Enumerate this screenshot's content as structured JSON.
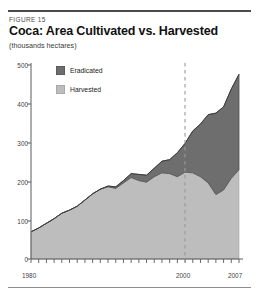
{
  "figure": {
    "label": "FIGURE 15",
    "title": "Coca: Area Cultivated vs. Harvested",
    "units": "(thousands hectares)"
  },
  "legend": {
    "position": "inside-top-left",
    "items": [
      {
        "label": "Eradicated",
        "color": "#6e6e6e",
        "swatch": "eradicated-swatch"
      },
      {
        "label": "Harvested",
        "color": "#bdbdbd",
        "swatch": "harvested-swatch"
      }
    ]
  },
  "axes": {
    "y_ticks": [
      "0",
      "100",
      "200",
      "300",
      "400",
      "500"
    ],
    "x_ticks_labeled": [
      "1980",
      "2000",
      "2007"
    ]
  },
  "annotations": [
    {
      "name": "year-2000-reference-line",
      "type": "vertical-dashed",
      "x_value": 2000,
      "color": "#9a9a9a"
    }
  ],
  "chart_data": {
    "type": "area",
    "stacked": true,
    "title": "Coca: Area Cultivated vs. Harvested",
    "subtitle": "FIGURE 15",
    "xlabel": "",
    "ylabel": "thousands hectares",
    "ylim": [
      0,
      500
    ],
    "xlim": [
      1980,
      2007
    ],
    "grid": false,
    "legend_entries": [
      "Eradicated",
      "Harvested"
    ],
    "x": [
      1980,
      1981,
      1982,
      1983,
      1984,
      1985,
      1986,
      1987,
      1988,
      1989,
      1990,
      1991,
      1992,
      1993,
      1994,
      1995,
      1996,
      1997,
      1998,
      1999,
      2000,
      2001,
      2002,
      2003,
      2004,
      2005,
      2006,
      2007
    ],
    "series": [
      {
        "name": "Harvested",
        "color": "#bdbdbd",
        "values": [
          70,
          80,
          92,
          104,
          118,
          126,
          136,
          152,
          168,
          180,
          186,
          182,
          196,
          210,
          202,
          198,
          212,
          222,
          220,
          212,
          224,
          222,
          212,
          196,
          166,
          178,
          208,
          230
        ]
      },
      {
        "name": "Eradicated",
        "color": "#6e6e6e",
        "values": [
          0,
          0,
          0,
          0,
          0,
          0,
          0,
          0,
          0,
          0,
          2,
          4,
          6,
          10,
          16,
          18,
          22,
          30,
          36,
          62,
          74,
          108,
          136,
          176,
          210,
          214,
          230,
          246
        ]
      }
    ],
    "totals": [
      70,
      80,
      92,
      104,
      118,
      126,
      136,
      152,
      168,
      180,
      188,
      186,
      202,
      220,
      218,
      216,
      234,
      252,
      256,
      274,
      298,
      330,
      348,
      372,
      376,
      392,
      438,
      476
    ]
  }
}
